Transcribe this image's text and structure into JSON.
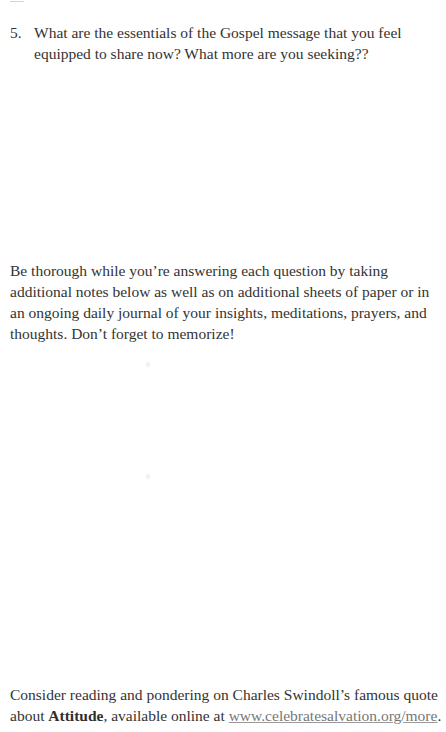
{
  "page": {
    "number_mark": "11"
  },
  "question": {
    "number": "5.",
    "text": "What are the essentials of the Gospel message that you feel equipped to share now? What more are you seeking??"
  },
  "instructions": {
    "text": "Be thorough while you’re answering each question by taking additional notes below as well as on additional sheets of paper or in an ongoing daily journal of your insights, meditations, prayers, and thoughts. Don’t forget to memorize!"
  },
  "footer": {
    "text_before": "Consider reading and pondering on Charles Swindoll’s famous quote about ",
    "bold_word": "Attitude",
    "text_middle": ", available online at ",
    "link_text": "www.celebratesalvation.org/more",
    "text_after": "."
  },
  "colors": {
    "text": "#333333",
    "link": "#777777",
    "background": "#ffffff"
  }
}
